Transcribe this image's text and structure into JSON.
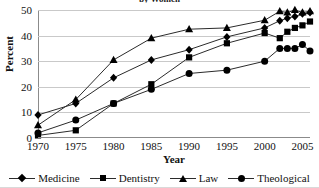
{
  "chart_data": {
    "type": "line",
    "title": "by Women",
    "xlabel": "Year",
    "ylabel": "Percent",
    "xlim": [
      1970,
      2006
    ],
    "ylim": [
      0,
      50
    ],
    "yticks": [
      0,
      10,
      20,
      30,
      40,
      50
    ],
    "xticks": [
      1970,
      1975,
      1980,
      1985,
      1990,
      1995,
      2000,
      2005
    ],
    "grid": true,
    "legend_position": "bottom",
    "marker_color": "#000000",
    "line_color": "#2b2b2b",
    "gridline_color": "#c9c9c9",
    "series": [
      {
        "name": "Medicine",
        "marker": "diamond",
        "x": [
          1970,
          1975,
          1980,
          1985,
          1990,
          1995,
          2000,
          2002,
          2003,
          2004,
          2005,
          2006
        ],
        "values": [
          9.0,
          13.5,
          23.5,
          30.5,
          34.5,
          39.5,
          43.0,
          45.8,
          46.8,
          47.5,
          48.5,
          49.0
        ]
      },
      {
        "name": "Dentistry",
        "marker": "square",
        "x": [
          1970,
          1975,
          1980,
          1985,
          1990,
          1995,
          2000,
          2002,
          2003,
          2004,
          2005,
          2006
        ],
        "values": [
          1.0,
          3.0,
          13.5,
          21.0,
          31.5,
          37.0,
          41.0,
          39.0,
          41.5,
          43.0,
          44.0,
          45.5
        ]
      },
      {
        "name": "Law",
        "marker": "triangle",
        "x": [
          1970,
          1975,
          1980,
          1985,
          1990,
          1995,
          2000,
          2002,
          2003,
          2004,
          2005,
          2006
        ],
        "values": [
          5.0,
          15.0,
          30.5,
          39.0,
          42.5,
          43.0,
          46.0,
          49.5,
          49.0,
          50.0,
          49.0,
          49.5
        ]
      },
      {
        "name": "Theological",
        "marker": "circle",
        "x": [
          1970,
          1975,
          1980,
          1985,
          1990,
          1995,
          2000,
          2002,
          2003,
          2004,
          2005,
          2006
        ],
        "values": [
          2.0,
          7.0,
          13.5,
          19.0,
          25.2,
          26.5,
          30.0,
          35.0,
          35.0,
          35.0,
          36.5,
          34.0
        ]
      }
    ]
  },
  "legend": {
    "items": [
      {
        "label": "Medicine",
        "marker": "diamond"
      },
      {
        "label": "Dentistry",
        "marker": "square"
      },
      {
        "label": "Law",
        "marker": "triangle"
      },
      {
        "label": "Theological",
        "marker": "circle"
      }
    ]
  }
}
